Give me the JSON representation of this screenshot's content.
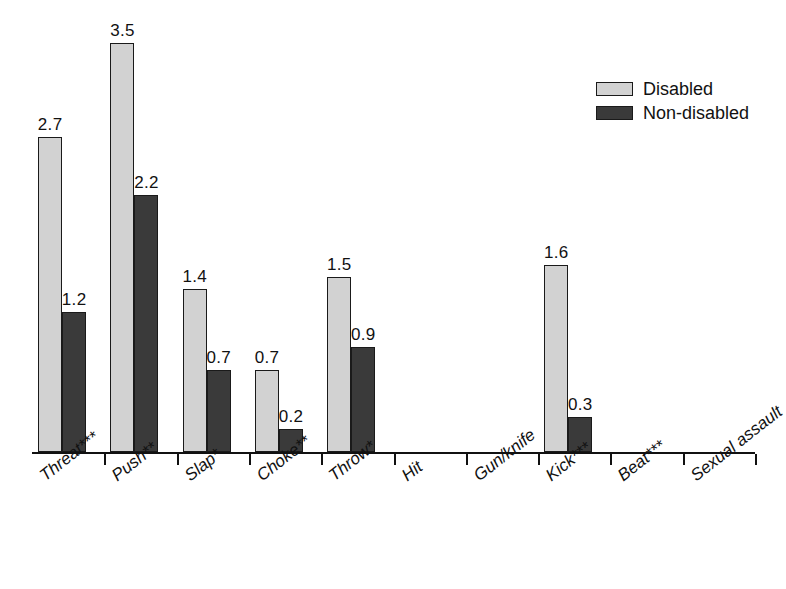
{
  "chart_data": {
    "type": "bar",
    "title": "",
    "subtitle": "",
    "xlabel": "",
    "ylabel": "",
    "ylim": [
      0,
      3.7
    ],
    "grid": false,
    "legend_position": "top-right",
    "categories": [
      "Threat***",
      "Push**",
      "Slap*",
      "Choke**",
      "Throw*",
      "Hit",
      "Gun/knife",
      "Kick***",
      "Beat***",
      "Sexual assault"
    ],
    "series": [
      {
        "name": "Disabled",
        "color": "#d2d2d2",
        "values": [
          2.7,
          3.5,
          1.4,
          0.7,
          1.5,
          0,
          0,
          1.6,
          0,
          0
        ],
        "labels": [
          "2.7",
          "3.5",
          "1.4",
          "0.7",
          "1.5",
          "",
          "",
          "1.6",
          "",
          ""
        ]
      },
      {
        "name": "Non-disabled",
        "color": "#3a3a3a",
        "values": [
          1.2,
          2.2,
          0.7,
          0.2,
          0.9,
          0,
          0,
          0.3,
          0,
          0
        ],
        "labels": [
          "1.2",
          "2.2",
          "0.7",
          "0.2",
          "0.9",
          "",
          "",
          "0.3",
          "",
          ""
        ]
      }
    ]
  },
  "legend": {
    "items": [
      {
        "label": "Disabled",
        "swatch": "light"
      },
      {
        "label": "Non-disabled",
        "swatch": "dark"
      }
    ]
  },
  "colors": {
    "disabled": "#d2d2d2",
    "non_disabled": "#3a3a3a",
    "axis": "#111111",
    "text": "#111111",
    "background": "#ffffff"
  }
}
